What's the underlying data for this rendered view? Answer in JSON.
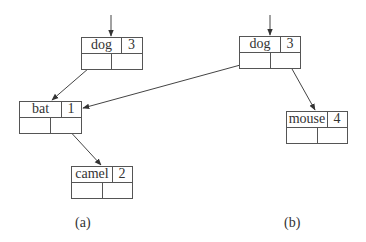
{
  "diagram": {
    "type": "binary-search-tree-nodes",
    "panels": [
      {
        "caption": "(a)",
        "nodes": [
          {
            "id": "a-dog",
            "key": "dog",
            "count": "3"
          },
          {
            "id": "a-bat",
            "key": "bat",
            "count": "1"
          },
          {
            "id": "a-camel",
            "key": "camel",
            "count": "2"
          }
        ],
        "edges": [
          {
            "from": "root",
            "to": "a-dog"
          },
          {
            "from": "a-dog.left",
            "to": "a-bat"
          },
          {
            "from": "a-bat.right",
            "to": "a-camel"
          }
        ]
      },
      {
        "caption": "(b)",
        "nodes": [
          {
            "id": "b-dog",
            "key": "dog",
            "count": "3"
          },
          {
            "id": "b-mouse",
            "key": "mouse",
            "count": "4"
          }
        ],
        "edges": [
          {
            "from": "root",
            "to": "b-dog"
          },
          {
            "from": "b-dog.left",
            "to": "a-bat"
          },
          {
            "from": "b-dog.right",
            "to": "b-mouse"
          }
        ]
      }
    ],
    "colors": {
      "line": "#555555",
      "text": "#333333",
      "background": "#ffffff"
    }
  }
}
